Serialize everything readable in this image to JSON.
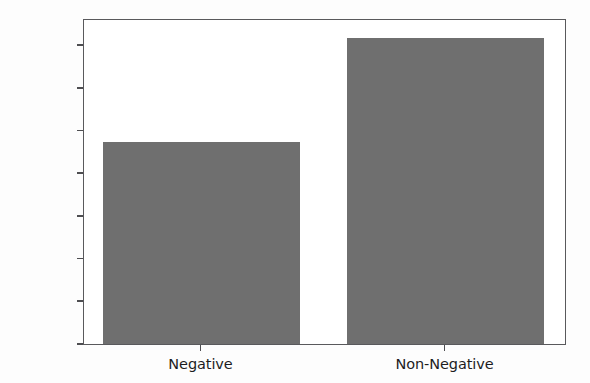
{
  "chart_data": {
    "type": "bar",
    "title": "",
    "subtitle": "",
    "xlabel": "",
    "ylabel": "",
    "categories": [
      "Negative",
      "Non-Negative"
    ],
    "values": [
      47400,
      71600
    ],
    "series": [
      {
        "name": "count",
        "values": [
          47400,
          71600
        ]
      }
    ],
    "ylim": [
      0,
      76300
    ],
    "xlim": [
      -0.5,
      1.5
    ],
    "ytick_labels": [
      "0",
      "10000",
      "20000",
      "30000",
      "40000",
      "50000",
      "60000",
      "70000"
    ],
    "ytick_values": [
      0,
      10000,
      20000,
      30000,
      40000,
      50000,
      60000,
      70000
    ],
    "xtick_labels": [
      "Negative",
      "Non-Negative"
    ],
    "grid": false,
    "legend": false,
    "legend_position": "none",
    "annotations": [],
    "bar_color": "#6f6f6f",
    "frame_color": "#59595c",
    "plot_background": "#ffffff",
    "figure_background": "#fdfdfd",
    "tick_color": "#4e4e51",
    "tick_text_color": "#1d1d1f"
  }
}
